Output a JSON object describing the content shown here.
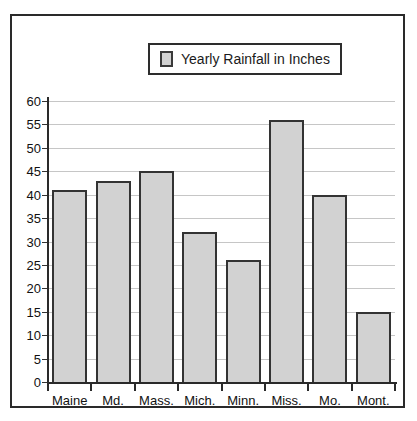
{
  "legend": {
    "swatch_color": "#d2d2d2",
    "label": "Yearly Rainfall in Inches"
  },
  "axis": {
    "y_ticks": [
      "0",
      "5",
      "10",
      "15",
      "20",
      "25",
      "30",
      "35",
      "40",
      "45",
      "50",
      "55",
      "60"
    ]
  },
  "colors": {
    "bar_fill": "#d2d2d2",
    "bar_border": "#333333",
    "gridline": "#c6c6c6",
    "axis": "#2a2a2a",
    "frame": "#2a2a2a",
    "text": "#111111",
    "background": "#ffffff"
  },
  "chart_data": {
    "type": "bar",
    "title": "",
    "xlabel": "",
    "ylabel": "",
    "categories": [
      "Maine",
      "Md.",
      "Mass.",
      "Mich.",
      "Minn.",
      "Miss.",
      "Mo.",
      "Mont."
    ],
    "values": [
      41,
      43,
      45,
      32,
      26,
      56,
      40,
      15
    ],
    "series": [
      {
        "name": "Yearly Rainfall in Inches",
        "values": [
          41,
          43,
          45,
          32,
          26,
          56,
          40,
          15
        ]
      }
    ],
    "ylim": [
      0,
      60
    ],
    "ytick_step": 5,
    "grid": true,
    "legend_position": "top-center"
  }
}
